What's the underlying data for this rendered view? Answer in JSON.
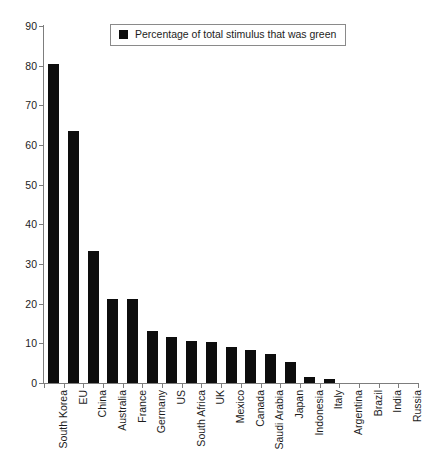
{
  "chart_data": {
    "type": "bar",
    "title": "",
    "xlabel": "",
    "ylabel": "",
    "ylim": [
      0,
      90
    ],
    "ytick_step": 10,
    "yticks": [
      0,
      10,
      20,
      30,
      40,
      50,
      60,
      70,
      80,
      90
    ],
    "grid": false,
    "legend_position": "top-center",
    "bar_color": "#0d0d0d",
    "axis_color": "#7d7d7d",
    "categories": [
      "South Korea",
      "EU",
      "China",
      "Australia",
      "France",
      "Germany",
      "US",
      "South Africa",
      "UK",
      "Mexico",
      "Canada",
      "Saudi Arabia",
      "Japan",
      "Indonesia",
      "Italy",
      "Argentina",
      "Brazil",
      "India",
      "Russia"
    ],
    "series": [
      {
        "name": "Percentage of total stimulus that was green",
        "values": [
          80.3,
          63.5,
          33.4,
          21.1,
          21.1,
          13.0,
          11.7,
          10.6,
          10.3,
          9.2,
          8.2,
          7.2,
          5.4,
          1.5,
          0.9,
          0.0,
          0.0,
          0.0,
          0.0
        ]
      }
    ]
  },
  "legend": {
    "label": "Percentage of total stimulus that was green"
  }
}
